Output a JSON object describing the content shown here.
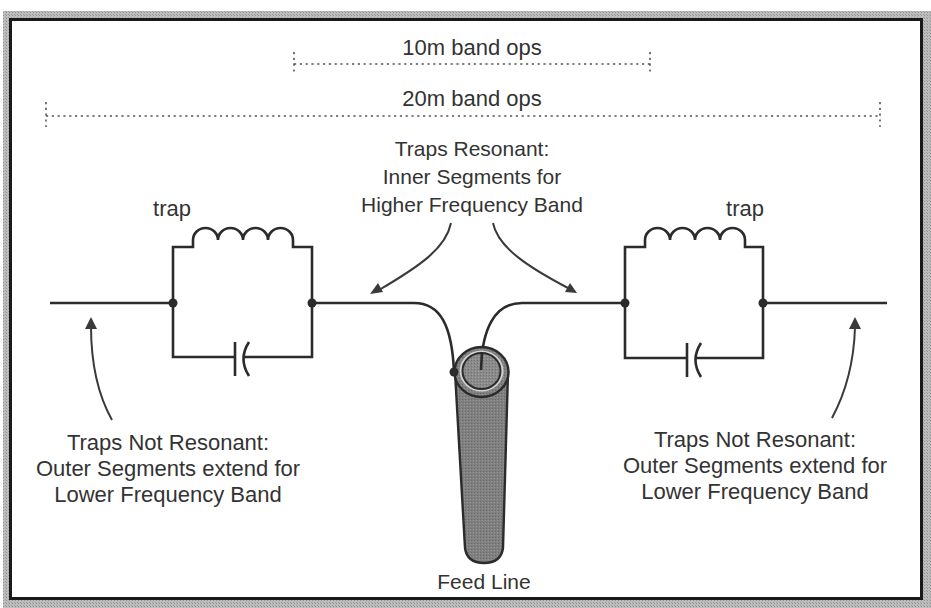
{
  "diagram": {
    "dimensions": [
      {
        "id": "10m",
        "label": "10m band ops"
      },
      {
        "id": "20m",
        "label": "20m band ops"
      }
    ],
    "center_caption": {
      "lines": [
        "Traps Resonant:",
        "Inner Segments for",
        "Higher Frequency Band"
      ]
    },
    "traps": [
      {
        "side": "left",
        "label": "trap"
      },
      {
        "side": "right",
        "label": "trap"
      }
    ],
    "outer_captions": [
      {
        "side": "left",
        "lines": [
          "Traps Not Resonant:",
          "Outer Segments extend for",
          "Lower Frequency Band"
        ]
      },
      {
        "side": "right",
        "lines": [
          "Traps Not Resonant:",
          "Outer Segments extend for",
          "Lower Frequency Band"
        ]
      }
    ],
    "feed_line": {
      "label": "Feed Line"
    },
    "colors": {
      "frame": "#1a1a1a",
      "shadow": "#9a9a9a",
      "wire": "#2b2b2b",
      "text": "#333333",
      "coax_fill": "#7a7a7a",
      "coax_inner": "#8c8c8c",
      "coax_ring": "#cfcfcf"
    }
  }
}
